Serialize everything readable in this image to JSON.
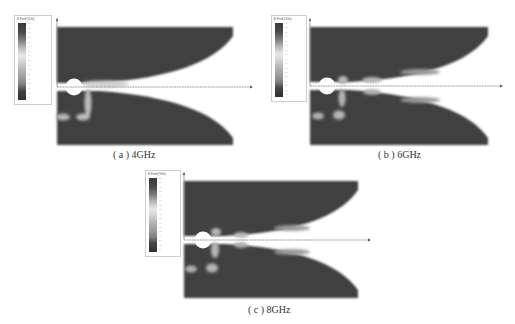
{
  "figure": {
    "panels": [
      {
        "id": "a",
        "caption": "( a ) 4GHz",
        "frequency": "4GHz",
        "legend": {
          "title": "E-Field [V/m]",
          "tick_count": 17,
          "ticks": [
            "",
            "",
            "",
            "",
            "",
            "",
            "",
            "",
            "",
            "",
            "",
            "",
            "",
            "",
            "",
            "",
            ""
          ]
        }
      },
      {
        "id": "b",
        "caption": "( b ) 6GHz",
        "frequency": "6GHz",
        "legend": {
          "title": "E-Field [V/m]",
          "tick_count": 17,
          "ticks": [
            "",
            "",
            "",
            "",
            "",
            "",
            "",
            "",
            "",
            "",
            "",
            "",
            "",
            "",
            "",
            "",
            ""
          ]
        }
      },
      {
        "id": "c",
        "caption": "( c ) 8GHz",
        "frequency": "8GHz",
        "legend": {
          "title": "E-Field [V/m]",
          "tick_count": 17,
          "ticks": [
            "",
            "",
            "",
            "",
            "",
            "",
            "",
            "",
            "",
            "",
            "",
            "",
            "",
            "",
            "",
            "",
            ""
          ]
        }
      }
    ],
    "colors": {
      "field_dark": "#3d3d3d",
      "field_light": "#bdbdbd",
      "background": "#ffffff",
      "axis": "#888888"
    }
  }
}
